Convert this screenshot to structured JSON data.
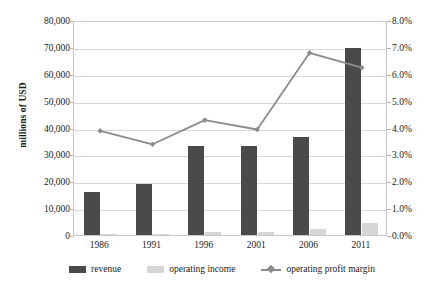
{
  "chart_data": {
    "type": "bar",
    "title": "",
    "xlabel": "",
    "ylabel": "millions of USD",
    "y2label": "",
    "categories": [
      "1986",
      "1991",
      "1996",
      "2001",
      "2006",
      "2011"
    ],
    "ylim": [
      0,
      80000
    ],
    "y2lim": [
      0,
      8.0
    ],
    "grid": true,
    "legend_position": "bottom",
    "y_ticks": [
      "0",
      "10,000",
      "20,000",
      "30,000",
      "40,000",
      "50,000",
      "60,000",
      "70,000",
      "80,000"
    ],
    "y_tick_values": [
      0,
      10000,
      20000,
      30000,
      40000,
      50000,
      60000,
      70000,
      80000
    ],
    "y2_ticks": [
      "0.0%",
      "1.0%",
      "2.0%",
      "3.0%",
      "4.0%",
      "5.0%",
      "6.0%",
      "7.0%",
      "8.0%"
    ],
    "y2_tick_values": [
      0,
      1,
      2,
      3,
      4,
      5,
      6,
      7,
      8
    ],
    "series": [
      {
        "name": "revenue",
        "kind": "bar",
        "axis": "left",
        "color": "#4a4a4a",
        "values": [
          16000,
          19000,
          33000,
          33000,
          36500,
          69500
        ]
      },
      {
        "name": "operating income",
        "kind": "bar",
        "axis": "left",
        "color": "#d6d6d6",
        "values": [
          300,
          400,
          1100,
          1300,
          2400,
          4500
        ]
      },
      {
        "name": "operating profit margin",
        "kind": "line",
        "axis": "right",
        "color": "#8c8c8c",
        "values": [
          3.95,
          3.45,
          4.35,
          4.0,
          6.85,
          6.3
        ]
      }
    ]
  },
  "legend": {
    "items": [
      {
        "label": "revenue"
      },
      {
        "label": "operating income"
      },
      {
        "label": "operating profit margin"
      }
    ]
  }
}
